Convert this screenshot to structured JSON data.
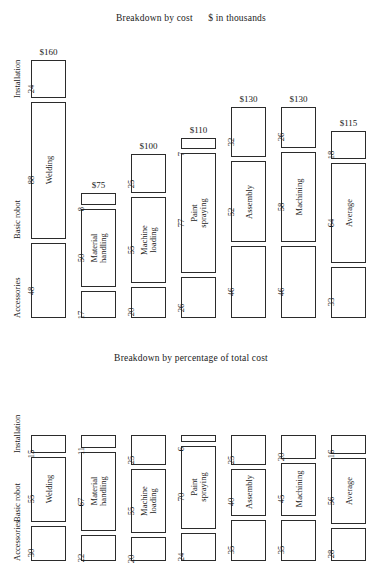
{
  "charts": [
    {
      "id": "breakdown-by-cost",
      "title": "Breakdown by cost      $ in thousands",
      "categories": [
        "Accessories",
        "Basic robot",
        "Installation"
      ],
      "columns": [
        {
          "name": "Welding",
          "total": "$160",
          "values": [
            48,
            88,
            24
          ]
        },
        {
          "name": "Material\nhandling",
          "total": "$75",
          "values": [
            17,
            50,
            8
          ]
        },
        {
          "name": "Machine\nloading",
          "total": "$100",
          "values": [
            20,
            55,
            25
          ]
        },
        {
          "name": "Paint\nspraying",
          "total": "$110",
          "values": [
            26,
            77,
            7
          ]
        },
        {
          "name": "Assembly",
          "total": "$130",
          "values": [
            46,
            52,
            32
          ]
        },
        {
          "name": "Machining",
          "total": "$130",
          "values": [
            46,
            58,
            26
          ]
        },
        {
          "name": "Average",
          "total": "$115",
          "values": [
            33,
            64,
            18
          ]
        }
      ]
    },
    {
      "id": "breakdown-by-percentage",
      "title": "Breakdown by percentage of total cost",
      "categories": [
        "Accessories",
        "Basic robot",
        "Installation"
      ],
      "columns": [
        {
          "name": "Welding",
          "total": "",
          "values": [
            30,
            55,
            15
          ]
        },
        {
          "name": "Material\nhandling",
          "total": "",
          "values": [
            22,
            67,
            11
          ]
        },
        {
          "name": "Machine\nloading",
          "total": "",
          "values": [
            20,
            55,
            25
          ]
        },
        {
          "name": "Paint\nspraying",
          "total": "",
          "values": [
            24,
            70,
            6
          ]
        },
        {
          "name": "Assembly",
          "total": "",
          "values": [
            35,
            40,
            25
          ]
        },
        {
          "name": "Machining",
          "total": "",
          "values": [
            35,
            45,
            20
          ]
        },
        {
          "name": "Average",
          "total": "",
          "values": [
            28,
            56,
            16
          ]
        }
      ]
    }
  ],
  "chart_data": [
    {
      "type": "bar",
      "subtype": "stacked-column",
      "title": "Breakdown by cost      $ in thousands",
      "xlabel": "",
      "ylabel": "$ in thousands",
      "categories": [
        "Welding",
        "Material handling",
        "Machine loading",
        "Paint spraying",
        "Assembly",
        "Machining",
        "Average"
      ],
      "series": [
        {
          "name": "Accessories",
          "values": [
            48,
            17,
            20,
            26,
            46,
            46,
            33
          ]
        },
        {
          "name": "Basic robot",
          "values": [
            88,
            50,
            55,
            77,
            52,
            58,
            64
          ]
        },
        {
          "name": "Installation",
          "values": [
            24,
            8,
            25,
            7,
            32,
            26,
            18
          ]
        }
      ],
      "totals": [
        160,
        75,
        100,
        110,
        130,
        130,
        115
      ],
      "total_labels": [
        "$160",
        "$75",
        "$100",
        "$110",
        "$130",
        "$130",
        "$115"
      ],
      "ylim": [
        0,
        160
      ],
      "grid": false,
      "legend": "none",
      "notes": "Segment order top-to-bottom: Accessories, Basic robot, Installation. Values printed beside each segment."
    },
    {
      "type": "bar",
      "subtype": "stacked-column",
      "title": "Breakdown by percentage of total cost",
      "xlabel": "",
      "ylabel": "percentage of total cost",
      "categories": [
        "Welding",
        "Material handling",
        "Machine loading",
        "Paint spraying",
        "Assembly",
        "Machining",
        "Average"
      ],
      "series": [
        {
          "name": "Accessories",
          "values": [
            30,
            22,
            20,
            24,
            35,
            35,
            28
          ]
        },
        {
          "name": "Basic robot",
          "values": [
            55,
            67,
            55,
            70,
            40,
            45,
            56
          ]
        },
        {
          "name": "Installation",
          "values": [
            15,
            11,
            25,
            6,
            25,
            20,
            16
          ]
        }
      ],
      "totals": [
        100,
        100,
        100,
        100,
        100,
        100,
        100
      ],
      "ylim": [
        0,
        100
      ],
      "grid": false,
      "legend": "none",
      "notes": "Segment order top-to-bottom: Accessories, Basic robot, Installation. Values printed beside each segment."
    }
  ]
}
